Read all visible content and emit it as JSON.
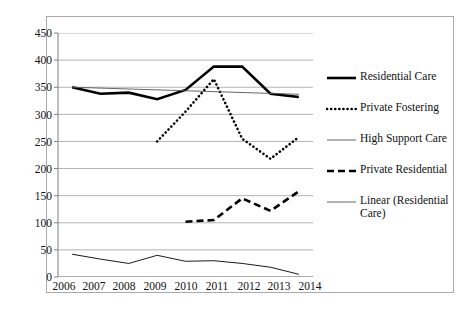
{
  "chart_data": {
    "type": "line",
    "title": "",
    "subtitle": "",
    "xlabel": "",
    "ylabel": "",
    "categories": [
      "2006",
      "2007",
      "2008",
      "2009",
      "2010",
      "2011",
      "2012",
      "2013",
      "2014"
    ],
    "ylim": [
      0,
      450
    ],
    "ytick_step": 50,
    "yticks": [
      "450",
      "400",
      "350",
      "300",
      "250",
      "200",
      "150",
      "100",
      "50",
      "0"
    ],
    "grid": true,
    "legend_position": "right",
    "series": [
      {
        "name": "Residential Care",
        "style": "solid-thick",
        "color": "#000000",
        "x": [
          "2006",
          "2007",
          "2008",
          "2009",
          "2010",
          "2011",
          "2012",
          "2013",
          "2014"
        ],
        "values": [
          350,
          338,
          340,
          328,
          345,
          388,
          388,
          338,
          332
        ]
      },
      {
        "name": "Private Fostering",
        "style": "dotted",
        "color": "#000000",
        "x": [
          "2009",
          "2010",
          "2011",
          "2012",
          "2013",
          "2014"
        ],
        "values": [
          250,
          305,
          365,
          255,
          218,
          258
        ]
      },
      {
        "name": "High Support Care",
        "style": "solid-thin",
        "color": "#000000",
        "x": [
          "2006",
          "2007",
          "2008",
          "2009",
          "2010",
          "2011",
          "2012",
          "2013",
          "2014"
        ],
        "values": [
          42,
          33,
          25,
          40,
          29,
          30,
          25,
          18,
          5
        ]
      },
      {
        "name": "Private Residential",
        "style": "dashed",
        "color": "#000000",
        "x": [
          "2010",
          "2011",
          "2012",
          "2013",
          "2014"
        ],
        "values": [
          102,
          105,
          145,
          122,
          158
        ]
      },
      {
        "name": "Linear (Residential Care)",
        "style": "trendline",
        "color": "#555555",
        "x": [
          "2006",
          "2014"
        ],
        "values": [
          350,
          337
        ]
      }
    ]
  },
  "legend": {
    "items": [
      {
        "label": "Residential Care",
        "style": "solid-thick"
      },
      {
        "label": "Private Fostering",
        "style": "dotted"
      },
      {
        "label": "High Support Care",
        "style": "solid-thin"
      },
      {
        "label": "Private Residential",
        "style": "dashed"
      },
      {
        "label": "Linear (Residential Care)",
        "style": "trendline"
      }
    ]
  },
  "axes": {
    "y_labels": [
      "450",
      "400",
      "350",
      "300",
      "250",
      "200",
      "150",
      "100",
      "50",
      "0"
    ],
    "x_labels": [
      "2006",
      "2007",
      "2008",
      "2009",
      "2010",
      "2011",
      "2012",
      "2013",
      "2014"
    ]
  },
  "colors": {
    "gridline": "#b3b3b3",
    "axis": "#808080",
    "series": "#000000",
    "frame": "#aaaaaa"
  }
}
